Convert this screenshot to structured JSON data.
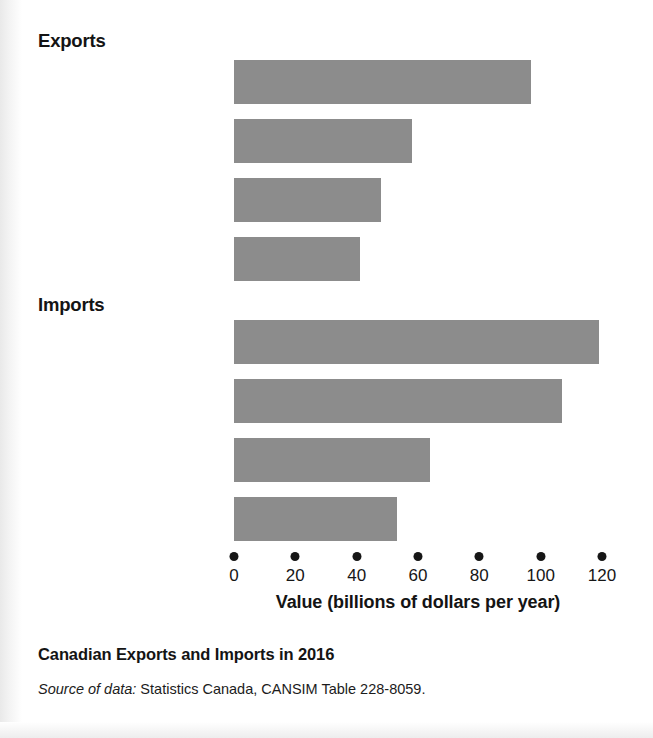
{
  "figure": {
    "caption_title": "Canadian Exports and Imports in 2016",
    "source_label": "Source of data:",
    "source_text": " Statistics Canada, CANSIM Table 228-8059.",
    "bar_color": "#8c8c8c",
    "text_color": "#141414"
  },
  "chart_data": {
    "type": "bar",
    "orientation": "horizontal",
    "title": "Canadian Exports and Imports in 2016",
    "xlabel": "Value (billions of dollars per year)",
    "ylabel": "",
    "xlim": [
      0,
      125
    ],
    "xticks": [
      0,
      20,
      40,
      60,
      80,
      100,
      120
    ],
    "xtick_labels": [
      "0",
      "20",
      "40",
      "60",
      "80",
      "100",
      "120"
    ],
    "grid": false,
    "legend": false,
    "groups": [
      {
        "name": "Exports",
        "categories": [
          "Motor vehicles and parts",
          "Metals and ores",
          "Crude oil",
          "Forestry products"
        ],
        "values": [
          97,
          58,
          48,
          41
        ]
      },
      {
        "name": "Imports",
        "categories": [
          "Consumer goods",
          "Motor vehicles and parts",
          "Electronic and electrical equipment",
          "Industrial machinery and equipment"
        ],
        "values": [
          119,
          107,
          64,
          53
        ]
      }
    ],
    "bars": [
      {
        "group": "Exports",
        "label_line1": "Motor vehicles",
        "label_line2": "and parts",
        "value": 97,
        "top": 60
      },
      {
        "group": "Exports",
        "label_line1": "Metals and ores",
        "label_line2": "",
        "value": 58,
        "top": 119
      },
      {
        "group": "Exports",
        "label_line1": "Crude oil",
        "label_line2": "",
        "value": 48,
        "top": 178
      },
      {
        "group": "Exports",
        "label_line1": "Forestry products",
        "label_line2": "",
        "value": 41,
        "top": 237
      },
      {
        "group": "Imports",
        "label_line1": "Consumer goods",
        "label_line2": "",
        "value": 119,
        "top": 320
      },
      {
        "group": "Imports",
        "label_line1": "Motor vehicles",
        "label_line2": "and parts",
        "value": 107,
        "top": 379
      },
      {
        "group": "Imports",
        "label_line1": "Electronic and",
        "label_line2": "electrical equipment",
        "value": 64,
        "top": 438
      },
      {
        "group": "Imports",
        "label_line1": "Industrial machinery",
        "label_line2": "and equipment",
        "value": 53,
        "top": 497
      }
    ],
    "group_headings": [
      {
        "name": "Exports",
        "text": "Exports"
      },
      {
        "name": "Imports",
        "text": "Imports"
      }
    ]
  }
}
